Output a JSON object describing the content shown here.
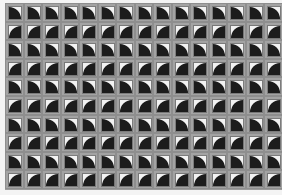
{
  "image": {
    "description": "Grayscale photo of a grid of square tiles, each with a white corner triangle and a dark quarter-circle",
    "grid": {
      "columns": 15,
      "rows": 10
    },
    "row_patterns": [
      "a",
      "b",
      "a",
      "b",
      "a",
      "b",
      "a",
      "b",
      "a",
      "b"
    ],
    "colors": {
      "background": "#f4f4f4",
      "tile_frame": "#a3a3a3",
      "dark_disc": "#1c1c1c",
      "light_corner": "#f2f2f2"
    }
  }
}
